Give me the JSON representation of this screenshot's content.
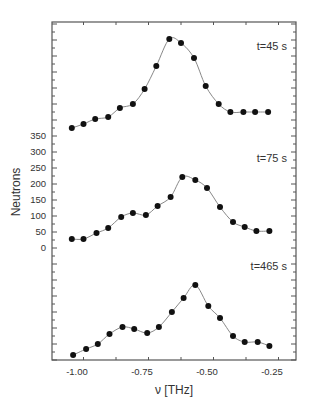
{
  "chart_data": {
    "type": "scatter",
    "title": "",
    "xlabel": "ν [THz]",
    "ylabel": "Neutrons",
    "xlim": [
      -1.1,
      -0.16
    ],
    "x_ticks": [
      -1.0,
      -0.75,
      -0.5,
      -0.25
    ],
    "x_tick_labels": [
      "-1.00",
      "-0.75",
      "-0.50",
      "-0.25"
    ],
    "y_ticks": [
      0,
      50,
      100,
      150,
      200,
      250,
      300,
      350
    ],
    "y_tick_labels": [
      "0",
      "50",
      "100",
      "150",
      "200",
      "250",
      "300",
      "350"
    ],
    "grid": false,
    "legend": "none",
    "note": "Three spectra stacked vertically with offsets; y tick labels apply to the middle (t=75 s) spectrum. Points are data markers, gray lines are fitted curves.",
    "series": [
      {
        "name": "t=45 s",
        "label": "t=45 s",
        "offset_px": 0,
        "x": [
          -1.02,
          -0.975,
          -0.93,
          -0.88,
          -0.835,
          -0.785,
          -0.74,
          -0.695,
          -0.645,
          -0.6,
          -0.55,
          -0.505,
          -0.455,
          -0.41,
          -0.36,
          -0.315,
          -0.265
        ],
        "y_px": [
          128,
          124,
          119,
          117,
          108,
          104,
          89,
          66,
          39,
          43,
          58,
          86,
          104,
          112,
          112,
          112,
          112
        ]
      },
      {
        "name": "t=75 s",
        "label": "t=75 s",
        "x": [
          -1.02,
          -0.975,
          -0.925,
          -0.88,
          -0.83,
          -0.785,
          -0.735,
          -0.69,
          -0.64,
          -0.595,
          -0.545,
          -0.5,
          -0.45,
          -0.4,
          -0.355,
          -0.31,
          -0.26
        ],
        "y": [
          25,
          25,
          44,
          59,
          94,
          106,
          100,
          128,
          156,
          219,
          209,
          184,
          125,
          78,
          63,
          50,
          50
        ],
        "y_px": [
          239,
          239,
          233,
          228,
          217,
          213,
          215,
          206,
          197,
          177,
          180,
          188,
          207,
          222,
          227,
          231,
          231
        ]
      },
      {
        "name": "t=465 s",
        "label": "t=465 s",
        "x": [
          -1.015,
          -0.965,
          -0.92,
          -0.875,
          -0.825,
          -0.78,
          -0.73,
          -0.685,
          -0.635,
          -0.59,
          -0.545,
          -0.495,
          -0.45,
          -0.4,
          -0.355,
          -0.305,
          -0.26
        ],
        "y_px": [
          355,
          349,
          344,
          334,
          327,
          329,
          333,
          327,
          312,
          298,
          285,
          306,
          318,
          336,
          342,
          342,
          346
        ]
      }
    ]
  },
  "labels": {
    "ylabel": "Neutrons",
    "xlabel": "ν [THz]",
    "annot_45": "t=45 s",
    "annot_75": "t=75 s",
    "annot_465": "t=465 s"
  }
}
